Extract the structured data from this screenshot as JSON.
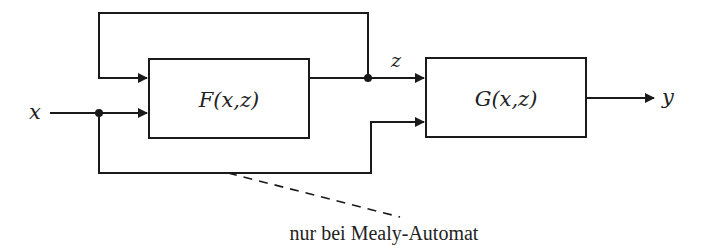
{
  "diagram": {
    "input_label": "x",
    "output_label": "y",
    "state_label": "z",
    "block_f_label": "F(x,z)",
    "block_g_label": "G(x,z)",
    "annotation": "nur bei Mealy-Automat",
    "colors": {
      "line": "#1a1a1a",
      "text": "#222222",
      "background": "#ffffff"
    }
  }
}
